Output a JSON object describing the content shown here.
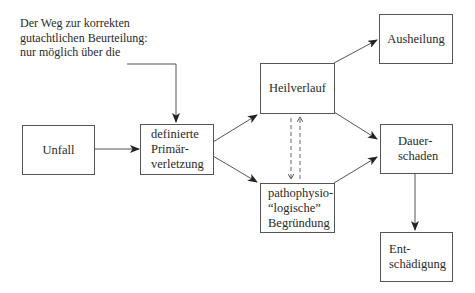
{
  "diagram": {
    "annotation": {
      "lines": [
        "Der Weg zur korrekten",
        "gutachtlichen Beurteilung:",
        "nur möglich über die"
      ]
    },
    "nodes": {
      "unfall": {
        "lines": [
          "Unfall"
        ]
      },
      "primaerverletzung": {
        "lines": [
          "definierte",
          "Primär-",
          "verletzung"
        ]
      },
      "heilverlauf": {
        "lines": [
          "Heilverlauf"
        ]
      },
      "pathophysiologisch": {
        "lines": [
          "pathophysio-",
          "“logische”",
          "Begründung"
        ]
      },
      "ausheilung": {
        "lines": [
          "Ausheilung"
        ]
      },
      "dauerschaden": {
        "lines": [
          "Dauer-",
          "schaden"
        ]
      },
      "entschaedigung": {
        "lines": [
          "Ent-",
          "schädigung"
        ]
      }
    },
    "edges": [
      {
        "from": "annotation",
        "to": "primaerverletzung",
        "style": "solid"
      },
      {
        "from": "unfall",
        "to": "primaerverletzung",
        "style": "solid"
      },
      {
        "from": "primaerverletzung",
        "to": "heilverlauf",
        "style": "solid"
      },
      {
        "from": "primaerverletzung",
        "to": "pathophysiologisch",
        "style": "solid"
      },
      {
        "from": "heilverlauf",
        "to": "pathophysiologisch",
        "style": "dashed"
      },
      {
        "from": "pathophysiologisch",
        "to": "heilverlauf",
        "style": "dashed"
      },
      {
        "from": "heilverlauf",
        "to": "ausheilung",
        "style": "solid"
      },
      {
        "from": "heilverlauf",
        "to": "dauerschaden",
        "style": "solid"
      },
      {
        "from": "pathophysiologisch",
        "to": "dauerschaden",
        "style": "solid"
      },
      {
        "from": "dauerschaden",
        "to": "entschaedigung",
        "style": "solid"
      }
    ],
    "colors": {
      "stroke": "#555555",
      "arrowhead": "#222222",
      "text": "#2a2a2a"
    }
  }
}
